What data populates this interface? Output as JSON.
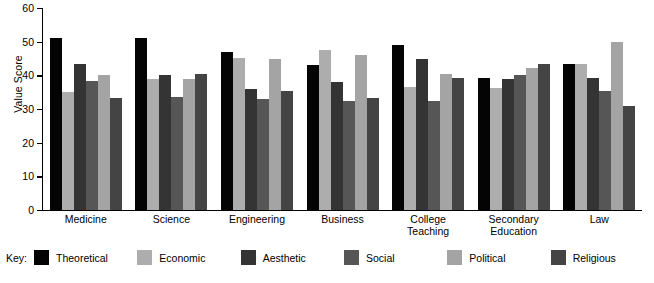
{
  "chart_data": {
    "type": "bar",
    "title": "",
    "xlabel": "",
    "ylabel": "Value Score",
    "ylim": [
      0,
      60
    ],
    "yticks": [
      0,
      10,
      20,
      30,
      40,
      50,
      60
    ],
    "grid": false,
    "legend_position": "bottom",
    "legend_title": "Key:",
    "categories": [
      "Medicine",
      "Science",
      "Engineering",
      "Business",
      "College\nTeaching",
      "Secondary\nEducation",
      "Law"
    ],
    "category_lines": [
      [
        "Medicine",
        ""
      ],
      [
        "Science",
        ""
      ],
      [
        "Engineering",
        ""
      ],
      [
        "Business",
        ""
      ],
      [
        "College",
        "Teaching"
      ],
      [
        "Secondary",
        "Education"
      ],
      [
        "Law",
        ""
      ]
    ],
    "series": [
      {
        "name": "Theoretical",
        "color": "#040404",
        "values": [
          51.0,
          51.0,
          47.0,
          43.0,
          49.0,
          39.3,
          43.3
        ]
      },
      {
        "name": "Economic",
        "color": "#adadad",
        "values": [
          35.0,
          39.0,
          45.3,
          47.4,
          36.4,
          36.3,
          43.3
        ]
      },
      {
        "name": "Aesthetic",
        "color": "#343434",
        "values": [
          43.3,
          40.0,
          36.0,
          38.0,
          45.0,
          39.0,
          39.3
        ]
      },
      {
        "name": "Social",
        "color": "#565656",
        "values": [
          38.3,
          33.5,
          33.0,
          32.3,
          32.3,
          40.0,
          35.3
        ]
      },
      {
        "name": "Political",
        "color": "#a4a4a4",
        "values": [
          40.0,
          39.0,
          45.0,
          46.0,
          40.5,
          42.3,
          50.0
        ]
      },
      {
        "name": "Religious",
        "color": "#444444",
        "values": [
          33.3,
          40.5,
          35.3,
          33.3,
          39.3,
          43.3,
          31.0
        ]
      }
    ]
  }
}
